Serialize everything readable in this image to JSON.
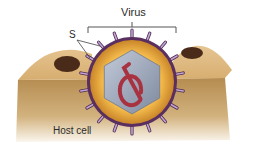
{
  "figure": {
    "type": "biology-illustration",
    "labels": {
      "virus": "Virus",
      "spike": "S",
      "host_cell": "Host cell"
    },
    "colors": {
      "background": "#ffffff",
      "host_cell_top": "#d9b27a",
      "host_cell_side": "#b48a4a",
      "host_cell_pit": "#4a2a18",
      "envelope_outer": "#5a2f5f",
      "envelope_fill": "#e8a93a",
      "capsid": "#a7b2c6",
      "capsid_shade": "#8893a8",
      "genome": "#a83240",
      "spike": "#b99ac4",
      "leader_line": "#444444"
    }
  }
}
